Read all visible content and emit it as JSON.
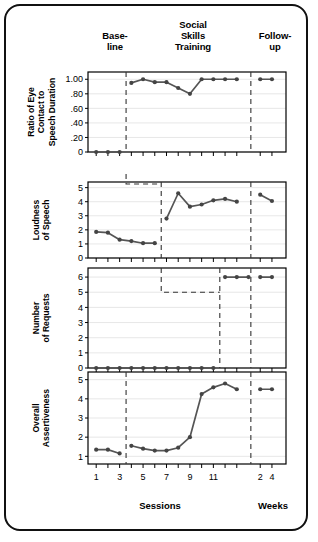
{
  "figure": {
    "phases": [
      {
        "key": "baseline",
        "label_line1": "Base-",
        "label_line2": "line"
      },
      {
        "key": "training",
        "label_line1": "Social",
        "label_line2": "Skills",
        "label_line3": "Training"
      },
      {
        "key": "followup",
        "label_line1": "Follow-",
        "label_line2": "up"
      }
    ],
    "x_axis": {
      "title_sessions": "Sessions",
      "title_weeks": "Weeks",
      "session_ticks": [
        "1",
        "3",
        "5",
        "7",
        "9",
        "11"
      ],
      "week_ticks": [
        "2",
        "4"
      ]
    },
    "colors": {
      "line": "#555555",
      "marker": "#444444",
      "axis": "#000000",
      "grid": "#dddddd",
      "phase_divider": "#333333",
      "frame": "#111111"
    }
  },
  "chart_data": [
    {
      "type": "line",
      "id": "panel-eye-contact",
      "title": "",
      "ylabel": "Ratio of Eye Contact to Speech Duration",
      "ylabel_lines": [
        "Ratio of Eye",
        "Contact to",
        "Speech Duration"
      ],
      "xlabel": "",
      "ylim": [
        0,
        1.1
      ],
      "yticks": [
        0,
        0.2,
        0.4,
        0.6,
        0.8,
        1.0
      ],
      "ytick_labels": [
        "0",
        ".20",
        ".40",
        ".60",
        ".80",
        "1.00"
      ],
      "grid": true,
      "xlim": [
        0.3,
        17.2
      ],
      "series": [
        {
          "name": "Baseline",
          "x": [
            1,
            2,
            3
          ],
          "values": [
            0.0,
            0.0,
            0.0
          ]
        },
        {
          "name": "Social Skills Training",
          "x": [
            4,
            5,
            6,
            7,
            8,
            9,
            10,
            11,
            12,
            13
          ],
          "values": [
            0.95,
            1.0,
            0.96,
            0.96,
            0.88,
            0.8,
            1.0,
            1.0,
            1.0,
            1.0
          ]
        },
        {
          "name": "Follow-up",
          "x": [
            15,
            16
          ],
          "values": [
            1.0,
            1.0
          ]
        }
      ]
    },
    {
      "type": "line",
      "id": "panel-loudness",
      "title": "",
      "ylabel": "Loudness of Speech",
      "ylabel_lines": [
        "Loudness",
        "of Speech"
      ],
      "xlabel": "",
      "ylim": [
        0,
        5.4
      ],
      "yticks": [
        0,
        1,
        2,
        3,
        4,
        5
      ],
      "ytick_labels": [
        "0",
        "1",
        "2",
        "3",
        "4",
        "5"
      ],
      "grid": true,
      "xlim": [
        0.3,
        17.2
      ],
      "series": [
        {
          "name": "Baseline",
          "x": [
            1,
            2,
            3,
            4,
            5,
            6
          ],
          "values": [
            1.85,
            1.8,
            1.3,
            1.2,
            1.05,
            1.05
          ]
        },
        {
          "name": "Social Skills Training",
          "x": [
            7,
            8,
            9,
            10,
            11,
            12,
            13
          ],
          "values": [
            2.8,
            4.6,
            3.65,
            3.8,
            4.1,
            4.2,
            4.0
          ]
        },
        {
          "name": "Follow-up",
          "x": [
            15,
            16
          ],
          "values": [
            4.5,
            4.05
          ]
        }
      ]
    },
    {
      "type": "line",
      "id": "panel-requests",
      "title": "",
      "ylabel": "Number of Requests",
      "ylabel_lines": [
        "Number",
        "of Requests"
      ],
      "xlabel": "",
      "ylim": [
        0,
        6.6
      ],
      "yticks": [
        0,
        1,
        2,
        3,
        4,
        5,
        6
      ],
      "ytick_labels": [
        "0",
        "1",
        "2",
        "3",
        "4",
        "5",
        "6"
      ],
      "grid": true,
      "xlim": [
        0.3,
        17.2
      ],
      "series": [
        {
          "name": "Baseline",
          "x": [
            1,
            2,
            3,
            4,
            5,
            6,
            7,
            8,
            9,
            10,
            11
          ],
          "values": [
            0,
            0,
            0,
            0,
            0,
            0,
            0,
            0,
            0,
            0,
            0
          ]
        },
        {
          "name": "Social Skills Training",
          "x": [
            12,
            13,
            14
          ],
          "values": [
            6,
            6,
            6
          ]
        },
        {
          "name": "Follow-up",
          "x": [
            15,
            16
          ],
          "values": [
            6,
            6
          ]
        }
      ]
    },
    {
      "type": "line",
      "id": "panel-assertiveness",
      "title": "",
      "ylabel": "Overall Assertiveness",
      "ylabel_lines": [
        "Overall",
        "Assertiveness"
      ],
      "xlabel": "Sessions",
      "ylim": [
        0.6,
        5.4
      ],
      "yticks": [
        1,
        2,
        3,
        4,
        5
      ],
      "ytick_labels": [
        "1",
        "2",
        "3",
        "4",
        "5"
      ],
      "grid": true,
      "xlim": [
        0.3,
        17.2
      ],
      "series": [
        {
          "name": "Baseline",
          "x": [
            1,
            2,
            3
          ],
          "values": [
            1.35,
            1.35,
            1.15
          ]
        },
        {
          "name": "Social Skills Training",
          "x": [
            4,
            5,
            6,
            7,
            8,
            9,
            10,
            11,
            12,
            13
          ],
          "values": [
            1.55,
            1.4,
            1.3,
            1.3,
            1.45,
            2.0,
            4.25,
            4.6,
            4.8,
            4.5
          ]
        },
        {
          "name": "Follow-up",
          "x": [
            15,
            16
          ],
          "values": [
            4.5,
            4.5
          ]
        }
      ]
    }
  ]
}
